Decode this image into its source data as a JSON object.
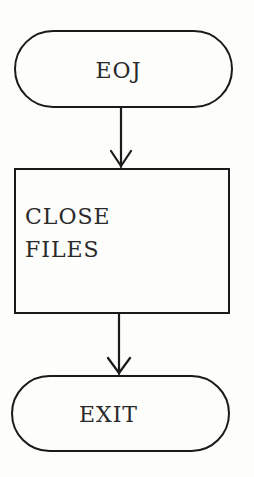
{
  "diagram": {
    "type": "flowchart",
    "nodes": [
      {
        "id": "eoj",
        "shape": "terminator",
        "label": "EOJ"
      },
      {
        "id": "close_files",
        "shape": "process",
        "lines": [
          "CLOSE",
          "FILES"
        ]
      },
      {
        "id": "exit",
        "shape": "terminator",
        "label": "EXIT"
      }
    ],
    "edges": [
      {
        "from": "eoj",
        "to": "close_files"
      },
      {
        "from": "close_files",
        "to": "exit"
      }
    ],
    "stroke_color": "#1a1a1a",
    "background": "#fdfdfb"
  }
}
